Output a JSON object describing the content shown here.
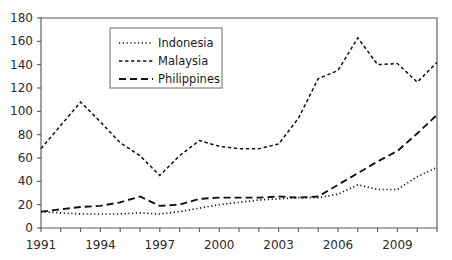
{
  "chart_data": {
    "type": "line",
    "title": "",
    "subtitle": "",
    "xlabel": "",
    "ylabel": "",
    "xlim": [
      1991,
      2011
    ],
    "ylim": [
      0,
      180
    ],
    "grid": false,
    "legend_position": "top-left-inside",
    "x": [
      1991,
      1992,
      1993,
      1994,
      1995,
      1996,
      1997,
      1998,
      1999,
      2000,
      2001,
      2002,
      2003,
      2004,
      2005,
      2006,
      2007,
      2008,
      2009,
      2010,
      2011
    ],
    "x_tick_labels": [
      "1991",
      "1994",
      "1997",
      "2000",
      "2003",
      "2006",
      "2009"
    ],
    "x_tick_values": [
      1991,
      1994,
      1997,
      2000,
      2003,
      2006,
      2009
    ],
    "y_tick_labels": [
      "0",
      "20",
      "40",
      "60",
      "80",
      "100",
      "120",
      "140",
      "160",
      "180"
    ],
    "y_tick_values": [
      0,
      20,
      40,
      60,
      80,
      100,
      120,
      140,
      160,
      180
    ],
    "series": [
      {
        "name": "Indonesia",
        "style": "dotted",
        "color": "#111111",
        "values": [
          14,
          13,
          12,
          12,
          12,
          13,
          12,
          14,
          17,
          20,
          22,
          24,
          25,
          26,
          26,
          29,
          37,
          33,
          33,
          44,
          52
        ]
      },
      {
        "name": "Malaysia",
        "style": "dashed-short",
        "color": "#111111",
        "values": [
          68,
          88,
          108,
          91,
          73,
          62,
          45,
          62,
          75,
          70,
          68,
          68,
          72,
          94,
          128,
          135,
          163,
          140,
          141,
          125,
          142
        ]
      },
      {
        "name": "Philippines",
        "style": "dashed-long",
        "color": "#111111",
        "values": [
          14,
          16,
          18,
          19,
          22,
          27,
          19,
          20,
          25,
          26,
          26,
          26,
          27,
          26,
          27,
          37,
          47,
          57,
          66,
          81,
          97
        ]
      }
    ]
  },
  "legend": {
    "entries": [
      {
        "label": "Indonesia"
      },
      {
        "label": "Malaysia"
      },
      {
        "label": "Philippines"
      }
    ]
  }
}
